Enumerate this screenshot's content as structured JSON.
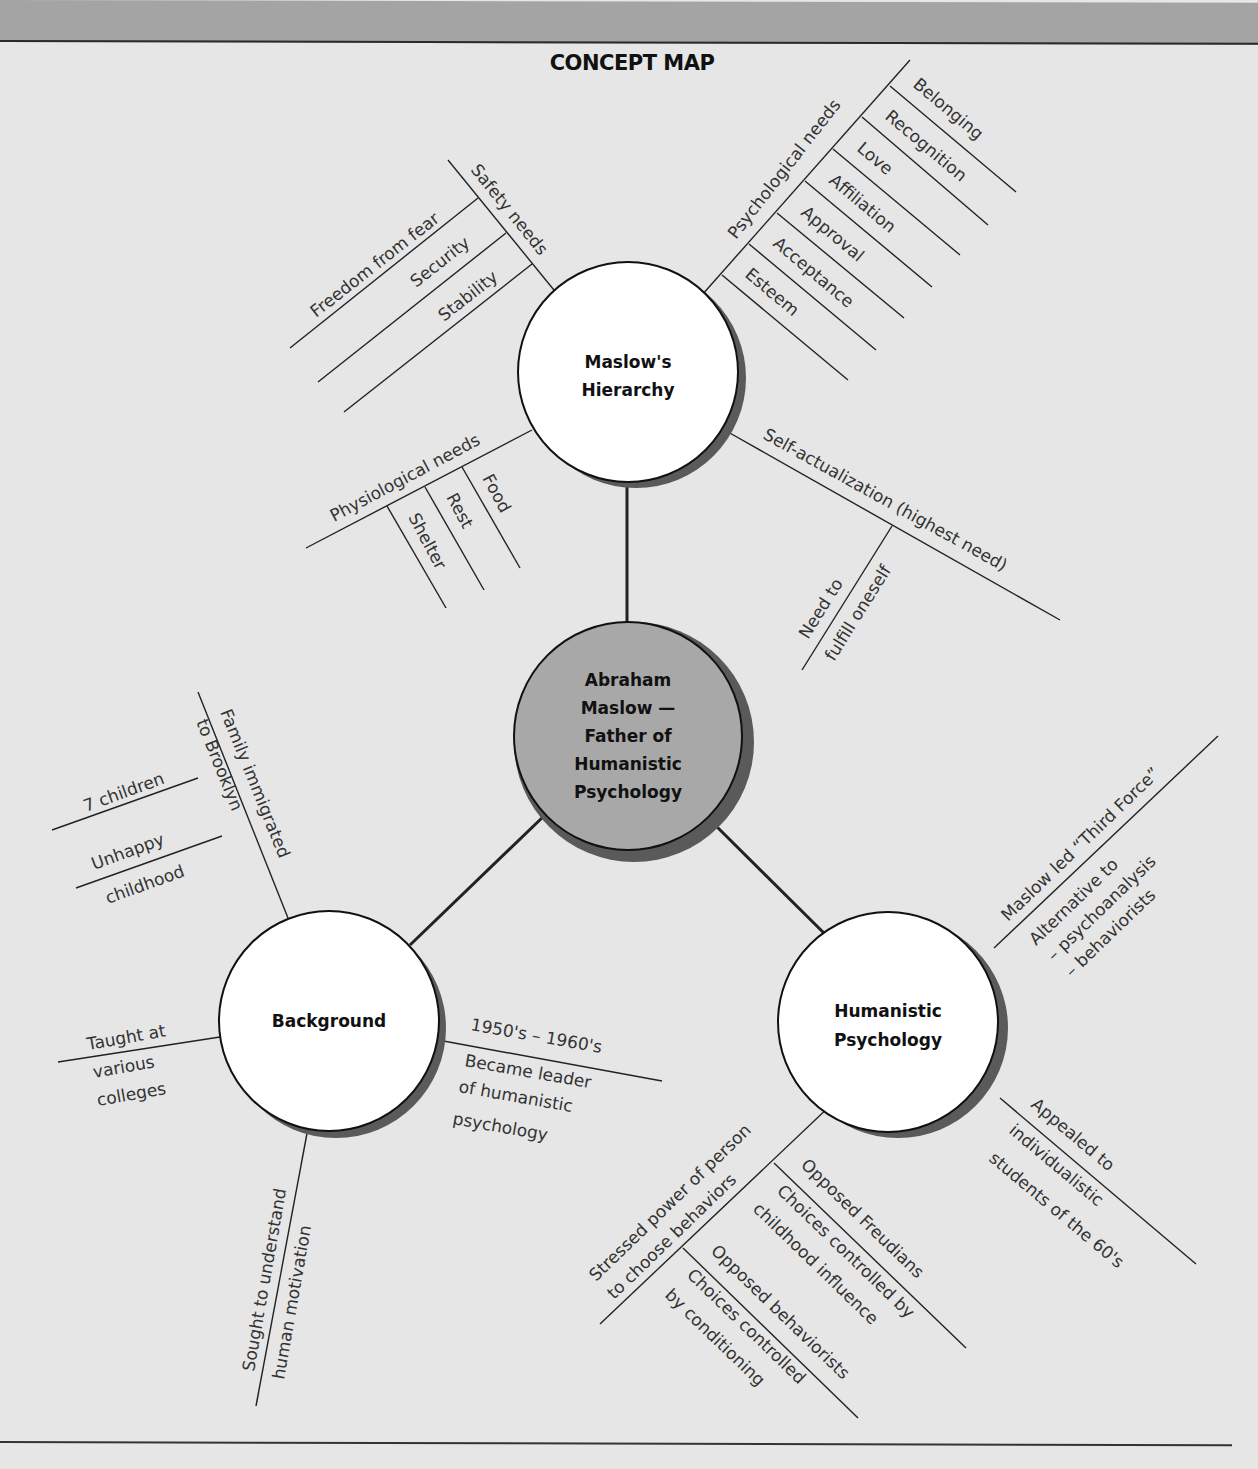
{
  "title": "CONCEPT MAP",
  "colors": {
    "background": "#e6e6e6",
    "header_band": "#a4a4a4",
    "center_node_fill": "#a8a8a8",
    "node_fill": "#ffffff",
    "line": "#222222"
  },
  "center": {
    "lines": [
      "Abraham",
      "Maslow —",
      "Father of",
      "Humanistic",
      "Psychology"
    ]
  },
  "nodes": {
    "maslow": {
      "lines": [
        "Maslow's",
        "Hierarchy"
      ],
      "branches": {
        "safety": {
          "label": "Safety needs",
          "items": [
            "Freedom from fear",
            "Security",
            "Stability"
          ]
        },
        "psychological": {
          "label": "Psychological needs",
          "items": [
            "Belonging",
            "Recognition",
            "Love",
            "Affiliation",
            "Approval",
            "Acceptance",
            "Esteem"
          ]
        },
        "physiological": {
          "label": "Physiological needs",
          "items": [
            "Food",
            "Rest",
            "Shelter"
          ]
        },
        "self_actualization": {
          "label": "Self-actualization (highest need)",
          "items": [
            "Need to",
            "fulfill oneself"
          ]
        }
      }
    },
    "background": {
      "label": "Background",
      "branches": {
        "family": {
          "label": "Family immigrated",
          "label2": "to Brooklyn",
          "items": [
            "7 children",
            "Unhappy",
            "childhood"
          ]
        },
        "taught": {
          "label": "Taught at",
          "label2": "various",
          "label3": "colleges"
        },
        "leader": {
          "label": "1950's – 1960's",
          "lines": [
            "Became leader",
            "of humanistic",
            "psychology"
          ]
        },
        "sought": {
          "label": "Sought to understand",
          "label2": "human motivation"
        }
      }
    },
    "humanistic": {
      "lines": [
        "Humanistic",
        "Psychology"
      ],
      "branches": {
        "third_force": {
          "label": "Maslow led “Third Force”",
          "lines": [
            "Alternative to",
            "– psychoanalysis",
            "– behaviorists"
          ]
        },
        "appealed": {
          "label": "Appealed to",
          "lines": [
            "individualistic",
            "students of the 60's"
          ]
        },
        "stressed": {
          "label": "Stressed power of person",
          "label2": "to choose behaviors",
          "freud": {
            "label": "Opposed Freudians",
            "lines": [
              "Choices controlled by",
              "childhood influence"
            ]
          },
          "behav": {
            "label": "Opposed behaviorists",
            "lines": [
              "Choices controlled",
              "by conditioning"
            ]
          }
        }
      }
    }
  }
}
